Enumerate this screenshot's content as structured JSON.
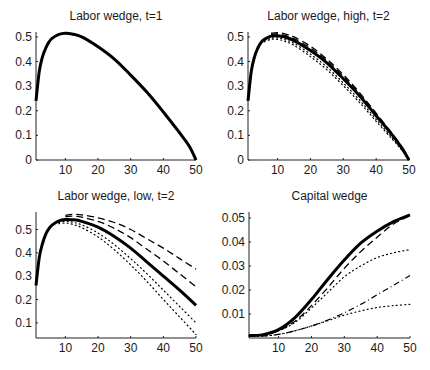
{
  "chart_data": [
    {
      "id": "tl",
      "type": "line",
      "title": "Labor wedge, t=1",
      "xlabel": "",
      "ylabel": "",
      "xlim": [
        1,
        50
      ],
      "ylim": [
        0,
        0.52
      ],
      "xticks": [
        10,
        20,
        30,
        40,
        50
      ],
      "yticks": [
        0,
        0.1,
        0.2,
        0.3,
        0.4,
        0.5
      ],
      "ytick_labels": [
        "0",
        "0.1",
        "0.2",
        "0.3",
        "0.4",
        "0.5"
      ],
      "grid": false,
      "frame": {
        "left": 36,
        "right": 196,
        "top": 32,
        "bottom": 160
      },
      "series": [
        {
          "name": "solid",
          "style": "solid",
          "width": 3,
          "x": [
            1,
            2,
            3,
            4,
            5,
            6,
            8,
            10,
            12,
            15,
            20,
            25,
            30,
            35,
            40,
            45,
            48,
            50
          ],
          "y": [
            0.24,
            0.36,
            0.42,
            0.455,
            0.48,
            0.495,
            0.51,
            0.515,
            0.512,
            0.5,
            0.46,
            0.41,
            0.345,
            0.275,
            0.195,
            0.11,
            0.055,
            0.0
          ]
        }
      ]
    },
    {
      "id": "tr",
      "type": "line",
      "title": "Labor wedge, high, t=2",
      "xlabel": "",
      "ylabel": "",
      "xlim": [
        1,
        50
      ],
      "ylim": [
        0,
        0.52
      ],
      "xticks": [
        10,
        20,
        30,
        40,
        50
      ],
      "yticks": [
        0,
        0.1,
        0.2,
        0.3,
        0.4,
        0.5
      ],
      "ytick_labels": [
        "0",
        "0.1",
        "0.2",
        "0.3",
        "0.4",
        "0.5"
      ],
      "grid": false,
      "frame": {
        "left": 248,
        "right": 409,
        "top": 32,
        "bottom": 160
      },
      "series": [
        {
          "name": "solid",
          "style": "solid",
          "width": 3,
          "x": [
            1,
            2,
            3,
            4,
            5,
            6,
            8,
            10,
            12,
            15,
            20,
            25,
            30,
            35,
            40,
            45,
            48,
            50
          ],
          "y": [
            0.24,
            0.36,
            0.42,
            0.455,
            0.478,
            0.49,
            0.503,
            0.505,
            0.5,
            0.485,
            0.445,
            0.395,
            0.33,
            0.26,
            0.18,
            0.1,
            0.045,
            0.0
          ]
        },
        {
          "name": "dashed-1",
          "style": "dashed",
          "width": 1.3,
          "x": [
            8,
            10,
            12,
            15,
            20,
            25,
            30,
            35,
            40,
            45,
            48,
            50
          ],
          "y": [
            0.515,
            0.517,
            0.513,
            0.5,
            0.462,
            0.41,
            0.347,
            0.273,
            0.19,
            0.105,
            0.05,
            0.0
          ]
        },
        {
          "name": "dashed-2",
          "style": "dashed",
          "width": 1.3,
          "x": [
            8,
            10,
            12,
            15,
            20,
            25,
            30,
            35,
            40,
            45,
            48,
            50
          ],
          "y": [
            0.51,
            0.512,
            0.507,
            0.493,
            0.455,
            0.403,
            0.34,
            0.267,
            0.185,
            0.102,
            0.048,
            0.0
          ]
        },
        {
          "name": "dotted-1",
          "style": "dotted",
          "width": 1.2,
          "x": [
            6,
            8,
            10,
            12,
            15,
            20,
            25,
            30,
            35,
            40,
            45,
            48,
            50
          ],
          "y": [
            0.485,
            0.495,
            0.496,
            0.49,
            0.474,
            0.43,
            0.378,
            0.313,
            0.243,
            0.165,
            0.088,
            0.04,
            0.0
          ]
        },
        {
          "name": "dotted-2",
          "style": "dotted",
          "width": 1.2,
          "x": [
            6,
            8,
            10,
            12,
            15,
            20,
            25,
            30,
            35,
            40,
            45,
            48,
            50
          ],
          "y": [
            0.48,
            0.49,
            0.49,
            0.483,
            0.466,
            0.42,
            0.367,
            0.302,
            0.233,
            0.157,
            0.083,
            0.037,
            0.0
          ]
        }
      ]
    },
    {
      "id": "bl",
      "type": "line",
      "title": "Labor wedge, low, t=2",
      "xlabel": "",
      "ylabel": "",
      "xlim": [
        1,
        50
      ],
      "ylim": [
        0.035,
        0.575
      ],
      "xticks": [
        10,
        20,
        30,
        40,
        50
      ],
      "yticks": [
        0.1,
        0.2,
        0.3,
        0.4,
        0.5
      ],
      "ytick_labels": [
        "0.1",
        "0.2",
        "0.3",
        "0.4",
        "0.5"
      ],
      "grid": false,
      "frame": {
        "left": 36,
        "right": 196,
        "top": 212,
        "bottom": 338
      },
      "series": [
        {
          "name": "solid",
          "style": "solid",
          "width": 3,
          "x": [
            1,
            2,
            3,
            4,
            5,
            6,
            8,
            10,
            12,
            15,
            20,
            25,
            30,
            35,
            40,
            45,
            50
          ],
          "y": [
            0.26,
            0.38,
            0.44,
            0.48,
            0.505,
            0.52,
            0.537,
            0.543,
            0.542,
            0.535,
            0.51,
            0.47,
            0.42,
            0.36,
            0.3,
            0.24,
            0.175
          ]
        },
        {
          "name": "dashed-1",
          "style": "dashed",
          "width": 1.3,
          "x": [
            10,
            12,
            15,
            20,
            25,
            30,
            35,
            40,
            45,
            50
          ],
          "y": [
            0.56,
            0.565,
            0.563,
            0.55,
            0.53,
            0.5,
            0.46,
            0.42,
            0.375,
            0.33
          ]
        },
        {
          "name": "dashed-2",
          "style": "dashed",
          "width": 1.3,
          "x": [
            10,
            12,
            15,
            20,
            25,
            30,
            35,
            40,
            45,
            50
          ],
          "y": [
            0.555,
            0.557,
            0.553,
            0.535,
            0.505,
            0.465,
            0.415,
            0.365,
            0.31,
            0.255
          ]
        },
        {
          "name": "dotted-1",
          "style": "dotted",
          "width": 1.2,
          "x": [
            8,
            10,
            12,
            15,
            20,
            25,
            30,
            35,
            40,
            45,
            50
          ],
          "y": [
            0.53,
            0.535,
            0.532,
            0.52,
            0.485,
            0.435,
            0.375,
            0.31,
            0.24,
            0.17,
            0.1
          ]
        },
        {
          "name": "dotted-2",
          "style": "dotted",
          "width": 1.2,
          "x": [
            8,
            10,
            12,
            15,
            20,
            25,
            30,
            35,
            40,
            45,
            50
          ],
          "y": [
            0.525,
            0.528,
            0.523,
            0.508,
            0.468,
            0.413,
            0.348,
            0.277,
            0.2,
            0.125,
            0.05
          ]
        }
      ]
    },
    {
      "id": "br",
      "type": "line",
      "title": "Capital wedge",
      "xlabel": "",
      "ylabel": "",
      "xlim": [
        1,
        50
      ],
      "ylim": [
        0,
        0.0525
      ],
      "xticks": [
        10,
        20,
        30,
        40,
        50
      ],
      "yticks": [
        0.01,
        0.02,
        0.03,
        0.04,
        0.05
      ],
      "ytick_labels": [
        "0.01",
        "0.02",
        "0.03",
        "0.04",
        "0.05"
      ],
      "grid": false,
      "frame": {
        "left": 249,
        "right": 410,
        "top": 212,
        "bottom": 338
      },
      "series": [
        {
          "name": "solid",
          "style": "solid",
          "width": 3,
          "x": [
            1,
            5,
            10,
            15,
            20,
            25,
            30,
            35,
            40,
            45,
            50
          ],
          "y": [
            0.001,
            0.0013,
            0.0035,
            0.0085,
            0.016,
            0.0245,
            0.0325,
            0.0395,
            0.0445,
            0.0485,
            0.0513
          ]
        },
        {
          "name": "dashed-1",
          "style": "dashed",
          "width": 1.3,
          "x": [
            1,
            5,
            10,
            15,
            20,
            25,
            30,
            35,
            40,
            45,
            50
          ],
          "y": [
            0.001,
            0.0012,
            0.003,
            0.007,
            0.0135,
            0.021,
            0.029,
            0.036,
            0.042,
            0.0475,
            0.051
          ]
        },
        {
          "name": "dotted-1",
          "style": "dotted",
          "width": 1.2,
          "x": [
            1,
            5,
            10,
            15,
            20,
            25,
            30,
            35,
            40,
            45,
            50
          ],
          "y": [
            0.001,
            0.0012,
            0.003,
            0.0065,
            0.0125,
            0.019,
            0.0255,
            0.03,
            0.0335,
            0.0355,
            0.0368
          ]
        },
        {
          "name": "dashdot-1",
          "style": "dashdot",
          "width": 1.2,
          "x": [
            1,
            5,
            10,
            15,
            20,
            25,
            30,
            35,
            40,
            45,
            50
          ],
          "y": [
            0.0008,
            0.0008,
            0.0015,
            0.003,
            0.005,
            0.0075,
            0.0105,
            0.014,
            0.018,
            0.022,
            0.026
          ]
        },
        {
          "name": "dotted-2",
          "style": "dotted",
          "width": 1.2,
          "x": [
            1,
            5,
            10,
            15,
            20,
            25,
            30,
            35,
            40,
            45,
            50
          ],
          "y": [
            0.0008,
            0.0008,
            0.0015,
            0.003,
            0.005,
            0.0072,
            0.0095,
            0.0113,
            0.0127,
            0.0135,
            0.014
          ]
        }
      ]
    }
  ]
}
